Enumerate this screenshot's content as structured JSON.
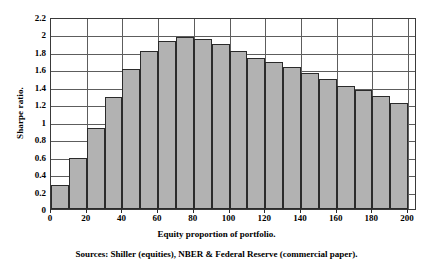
{
  "chart_data": {
    "type": "bar",
    "title": "",
    "xlabel": "Equity proportion of portfolio.",
    "ylabel": "Sharpe ratio.",
    "categories": [
      10,
      20,
      30,
      40,
      50,
      60,
      70,
      80,
      90,
      100,
      110,
      120,
      130,
      140,
      150,
      160,
      170,
      180,
      190,
      200
    ],
    "values": [
      0.27,
      0.58,
      0.93,
      1.28,
      1.6,
      1.81,
      1.93,
      1.97,
      1.95,
      1.89,
      1.81,
      1.73,
      1.69,
      1.63,
      1.56,
      1.49,
      1.41,
      1.36,
      1.3,
      1.22
    ],
    "bar_width": 10,
    "xlim": [
      0,
      205
    ],
    "ylim": [
      0,
      2.2
    ],
    "xticks": [
      0,
      20,
      40,
      60,
      80,
      100,
      120,
      140,
      160,
      180,
      200
    ],
    "xtick_labels": [
      "0",
      "20",
      "40",
      "60",
      "80",
      "100",
      "120",
      "140",
      "160",
      "180",
      "200"
    ],
    "yticks": [
      0,
      0.2,
      0.4,
      0.6,
      0.8,
      1.0,
      1.2,
      1.4,
      1.6,
      1.8,
      2.0,
      2.2
    ],
    "ytick_labels": [
      "0",
      "0.2",
      "0.4",
      "0.6",
      "0.8",
      "1",
      "1.2",
      "1.4",
      "1.6",
      "1.8",
      "2",
      "2.2"
    ],
    "grid": {
      "horizontal": true,
      "vertical": true,
      "vertical_step": 20
    },
    "legend": null,
    "bar_color": "#b2b2b2",
    "bar_border_color": "#2b2b2b",
    "grid_color": "#5d5d5d",
    "axis_color": "#3a3a3a",
    "background": "#ffffff"
  },
  "caption": {
    "sources": "Sources: Shiller (equities), NBER & Federal Reserve (commercial paper)."
  }
}
